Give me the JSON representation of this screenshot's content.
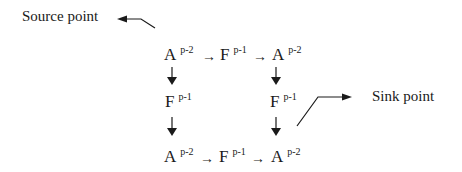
{
  "labels": {
    "source": "Source point",
    "sink": "Sink point"
  },
  "arrow_glyph": "→",
  "grid": {
    "top_row": [
      {
        "base": "A",
        "sup": "p-2"
      },
      {
        "base": "F",
        "sup": "p-1"
      },
      {
        "base": "A",
        "sup": "p-2"
      }
    ],
    "middle_row": [
      {
        "base": "F",
        "sup": "p-1"
      },
      {
        "base": "F",
        "sup": "p-1"
      }
    ],
    "bottom_row": [
      {
        "base": "A",
        "sup": "p-2"
      },
      {
        "base": "F",
        "sup": "p-1"
      },
      {
        "base": "A",
        "sup": "p-2"
      }
    ]
  },
  "colors": {
    "ink": "#1a1a1a",
    "background": "#ffffff"
  }
}
